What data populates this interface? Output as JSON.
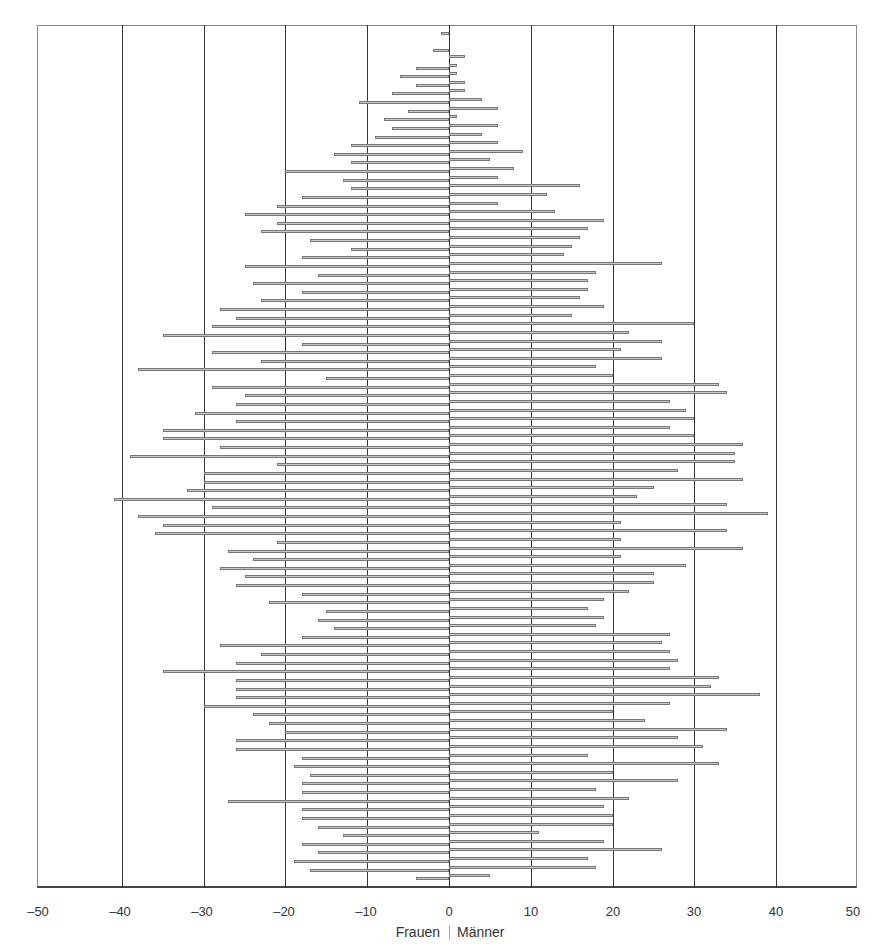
{
  "chart_data": {
    "type": "bar",
    "orientation": "horizontal",
    "subtype": "population-pyramid",
    "title": "",
    "xlabel_left": "Frauen",
    "xlabel_right": "Männer",
    "xlim": [
      -50,
      50
    ],
    "xticks": [
      -50,
      -40,
      -30,
      -20,
      -10,
      0,
      10,
      20,
      30,
      40,
      50
    ],
    "xtick_labels": [
      "–50",
      "–40",
      "–30",
      "–20",
      "–10",
      "0",
      "10",
      "20",
      "30",
      "40",
      "50"
    ],
    "grid": {
      "vertical": true,
      "horizontal": false
    },
    "row_order": "top-to-bottom",
    "series": [
      {
        "name": "Frauen",
        "side": "left",
        "values": [
          1,
          0,
          2,
          0,
          4,
          6,
          4,
          7,
          11,
          5,
          8,
          7,
          9,
          12,
          14,
          12,
          20,
          13,
          12,
          18,
          21,
          25,
          21,
          23,
          17,
          12,
          18,
          25,
          16,
          24,
          18,
          23,
          28,
          26,
          29,
          35,
          18,
          29,
          23,
          38,
          15,
          29,
          25,
          26,
          31,
          26,
          35,
          35,
          28,
          39,
          21,
          30,
          30,
          32,
          41,
          29,
          38,
          35,
          36,
          21,
          27,
          24,
          28,
          25,
          26,
          18,
          22,
          15,
          16,
          14,
          18,
          28,
          23,
          26,
          35,
          26,
          26,
          26,
          30,
          24,
          22,
          20,
          26,
          26,
          18,
          19,
          17,
          18,
          18,
          27,
          18,
          18,
          16,
          13,
          18,
          16,
          19,
          17,
          4
        ]
      },
      {
        "name": "Männer",
        "side": "right",
        "values": [
          0,
          0,
          0,
          2,
          1,
          1,
          2,
          2,
          4,
          6,
          1,
          6,
          4,
          6,
          9,
          5,
          8,
          6,
          16,
          12,
          6,
          13,
          19,
          17,
          16,
          15,
          14,
          26,
          18,
          17,
          17,
          16,
          19,
          15,
          30,
          22,
          26,
          21,
          26,
          18,
          20,
          33,
          34,
          27,
          29,
          30,
          27,
          30,
          36,
          35,
          35,
          28,
          36,
          25,
          23,
          34,
          39,
          21,
          34,
          21,
          36,
          21,
          29,
          25,
          25,
          22,
          19,
          17,
          19,
          18,
          27,
          26,
          27,
          28,
          27,
          33,
          32,
          38,
          27,
          20,
          24,
          34,
          28,
          31,
          17,
          33,
          20,
          28,
          18,
          22,
          19,
          20,
          20,
          11,
          19,
          26,
          17,
          18,
          5
        ]
      }
    ]
  },
  "axis": {
    "labels": [
      "–50",
      "–40",
      "–30",
      "–20",
      "–10",
      "0",
      "10",
      "20",
      "30",
      "40",
      "50"
    ],
    "left_caption": "Frauen",
    "right_caption": "Männer"
  }
}
